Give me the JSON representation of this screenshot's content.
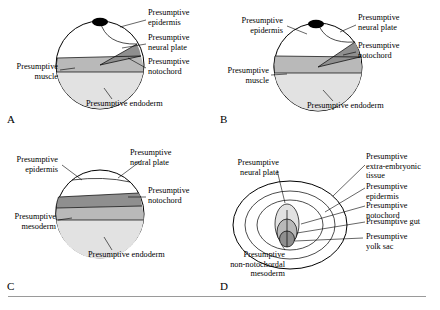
{
  "figure": {
    "title": "",
    "panels": [
      {
        "letter": "A",
        "labels": [
          {
            "id": "a-presumptive-epidermis",
            "text": "Presumptive\nepidermis"
          },
          {
            "id": "a-presumptive-neural-plate",
            "text": "Presumptive\nneural plate"
          },
          {
            "id": "a-presumptive-notochord",
            "text": "Presumptive\nnotochord"
          },
          {
            "id": "a-presumptive-muscle",
            "text": "Presumptive\nmuscle"
          },
          {
            "id": "a-presumptive-endoderm",
            "text": "Presumptive endoderm"
          }
        ]
      },
      {
        "letter": "B",
        "labels": [
          {
            "id": "b-presumptive-epidermis",
            "text": "Presumptive\nepidermis"
          },
          {
            "id": "b-presumptive-neural-plate",
            "text": "Presumptive\nneural plate"
          },
          {
            "id": "b-presumptive-notochord",
            "text": "Presumptive\nnotochord"
          },
          {
            "id": "b-presumptive-muscle",
            "text": "Presumptive\nmuscle"
          },
          {
            "id": "b-presumptive-endoderm",
            "text": "Presumptive endoderm"
          }
        ]
      },
      {
        "letter": "C",
        "labels": [
          {
            "id": "c-presumptive-epidermis",
            "text": "Presumptive\nepidermis"
          },
          {
            "id": "c-presumptive-neural-plate",
            "text": "Presumptive\nneural plate"
          },
          {
            "id": "c-presumptive-notochord",
            "text": "Presumptive\nnotochord"
          },
          {
            "id": "c-presumptive-mesoderm",
            "text": "Presumptive\nmesoderm"
          },
          {
            "id": "c-presumptive-endoderm",
            "text": "Presumptive endoderm"
          }
        ]
      },
      {
        "letter": "D",
        "labels": [
          {
            "id": "d-presumptive-neural-plate",
            "text": "Presumptive\nneural plate"
          },
          {
            "id": "d-presumptive-extra-embryonic-tissue",
            "text": "Presumptive\nextra-embryonic tissue"
          },
          {
            "id": "d-presumptive-epidermis",
            "text": "Presumptive epidermis"
          },
          {
            "id": "d-presumptive-notochord",
            "text": "Presumptive notochord"
          },
          {
            "id": "d-presumptive-gut",
            "text": "Presumptive gut"
          },
          {
            "id": "d-presumptive-yolk-sac",
            "text": "Presumptive\nyolk sac"
          },
          {
            "id": "d-presumptive-non-notochordal-mesoderm",
            "text": "Presumptive\nnon-notochordal\nmesoderm"
          }
        ]
      }
    ],
    "colors": {
      "outline": "#000000",
      "white_region": "#ffffff",
      "light_gray_region": "#e2e2e2",
      "mid_gray_region": "#b9b9b9",
      "dark_gray_region": "#8f8f8f",
      "rule": "#9a9a9a"
    }
  }
}
